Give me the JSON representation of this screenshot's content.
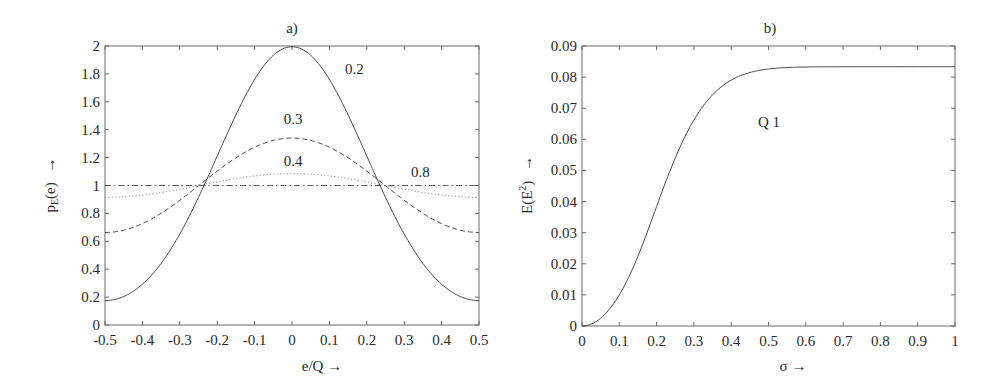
{
  "chart_data": [
    {
      "type": "line",
      "title": "a)",
      "xlabel": "e/Q →",
      "ylabel": "p_E(e) →",
      "xlim": [
        -0.5,
        0.5
      ],
      "ylim": [
        0,
        2
      ],
      "grid": false,
      "legend": "none (inline curve annotations)",
      "x_ticks": [
        "-0.5",
        "-0.4",
        "-0.3",
        "-0.2",
        "-0.1",
        "0",
        "0.1",
        "0.2",
        "0.3",
        "0.4",
        "0.5"
      ],
      "y_ticks": [
        "0",
        "0.2",
        "0.4",
        "0.6",
        "0.8",
        "1",
        "1.2",
        "1.4",
        "1.6",
        "1.8",
        "2"
      ],
      "x": [
        -0.5,
        -0.4,
        -0.3,
        -0.2,
        -0.1,
        0,
        0.1,
        0.2,
        0.3,
        0.4,
        0.5
      ],
      "series": [
        {
          "name": "0.2",
          "sigma": 0.2,
          "style": "solid",
          "values": [
            0.18,
            0.42,
            0.87,
            1.25,
            1.76,
            1.99,
            1.76,
            1.25,
            0.87,
            0.42,
            0.18
          ]
        },
        {
          "name": "0.3",
          "sigma": 0.3,
          "style": "dashed",
          "values": [
            0.66,
            0.73,
            0.9,
            1.1,
            1.27,
            1.34,
            1.27,
            1.1,
            0.9,
            0.73,
            0.66
          ]
        },
        {
          "name": "0.4",
          "sigma": 0.4,
          "style": "dotted",
          "values": [
            0.92,
            0.94,
            0.98,
            1.03,
            1.07,
            1.08,
            1.07,
            1.03,
            0.98,
            0.94,
            0.92
          ]
        },
        {
          "name": "0.8",
          "sigma": 0.8,
          "style": "dashdot",
          "values": [
            1.0,
            1.0,
            1.0,
            1.0,
            1.0,
            1.0,
            1.0,
            1.0,
            1.0,
            1.0,
            1.0
          ]
        }
      ],
      "annotations": [
        {
          "text": "0.2",
          "x": 0.14,
          "y": 1.82
        },
        {
          "text": "0.3",
          "x": 0.0,
          "y": 1.43
        },
        {
          "text": "0.4",
          "x": 0.0,
          "y": 1.12
        },
        {
          "text": "0.8",
          "x": 0.36,
          "y": 1.04
        }
      ]
    },
    {
      "type": "line",
      "title": "b)",
      "xlabel": "σ →",
      "ylabel": "E(E²) →",
      "xlim": [
        0,
        1
      ],
      "ylim": [
        0,
        0.09
      ],
      "grid": false,
      "x_ticks": [
        "0",
        "0.1",
        "0.2",
        "0.3",
        "0.4",
        "0.5",
        "0.6",
        "0.7",
        "0.8",
        "0.9",
        "1"
      ],
      "y_ticks": [
        "0",
        "0.01",
        "0.02",
        "0.03",
        "0.04",
        "0.05",
        "0.06",
        "0.07",
        "0.08",
        "0.09"
      ],
      "x": [
        0,
        0.1,
        0.2,
        0.3,
        0.4,
        0.5,
        0.6,
        0.7,
        0.8,
        0.9,
        1
      ],
      "series": [
        {
          "name": "Q 1",
          "style": "solid",
          "values": [
            0,
            0.01,
            0.0379,
            0.0676,
            0.0806,
            0.083,
            0.0833,
            0.0833,
            0.0833,
            0.0833,
            0.0833
          ]
        }
      ],
      "annotations": [
        {
          "text": "Q 1",
          "x": 0.5,
          "y": 0.0655
        }
      ]
    }
  ],
  "panels": {
    "a": {
      "title": "a)",
      "xlabel_main": "e/Q",
      "xlabel_arrow": "→",
      "ylabel_main": "p",
      "ylabel_sub": "E",
      "ylabel_rest": "(e)",
      "ylabel_arrow": "→",
      "labels": {
        "s02": "0.2",
        "s03": "0.3",
        "s04": "0.4",
        "s08": "0.8"
      }
    },
    "b": {
      "title": "b)",
      "xlabel": "σ →",
      "ylabel_main": "E(E",
      "ylabel_sup": "2",
      "ylabel_rest": ")",
      "ylabel_arrow": "→",
      "annotation": "Q 1"
    }
  },
  "colors": {
    "axis": "#6a6a6a",
    "curve": "#4a4a4a",
    "dotted": "#9a9a9a",
    "text": "#2a2a2a"
  }
}
